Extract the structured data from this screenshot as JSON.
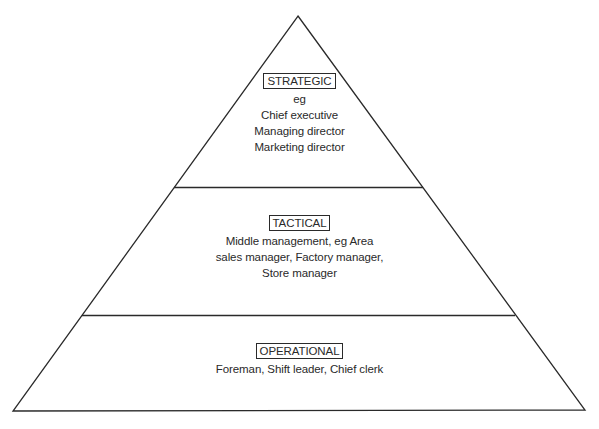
{
  "diagram": {
    "type": "pyramid",
    "colors": {
      "stroke": "#2a2a2a",
      "background": "#ffffff",
      "text": "#2a2a2a"
    },
    "tiers": [
      {
        "label": "STRATEGIC",
        "lines": [
          "eg",
          "Chief executive",
          "Managing director",
          "Marketing director"
        ]
      },
      {
        "label": "TACTICAL",
        "lines": [
          "Middle management, eg Area",
          "sales manager, Factory manager,",
          "Store manager"
        ]
      },
      {
        "label": "OPERATIONAL",
        "lines": [
          "Foreman, Shift leader, Chief clerk"
        ]
      }
    ]
  }
}
